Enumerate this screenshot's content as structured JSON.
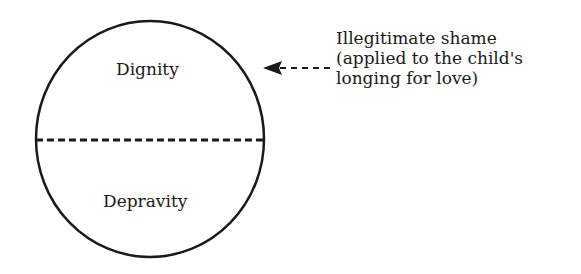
{
  "diagram": {
    "circle": {
      "upper_label": "Dignity",
      "lower_label": "Depravity",
      "divider": "dashed"
    },
    "annotation": {
      "lines": [
        "Illegitimate shame",
        "(applied to the child's",
        "longing for love)"
      ],
      "arrow_direction": "left"
    },
    "colors": {
      "stroke": "#1a1a1a",
      "background": "#ffffff"
    }
  }
}
